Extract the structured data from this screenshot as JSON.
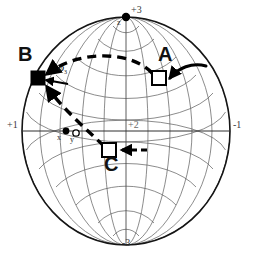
{
  "figure": {
    "type": "stereographic-sphere-diagram",
    "width": 253,
    "height": 261
  },
  "colors": {
    "background": "#ffffff",
    "grid": "#555555",
    "outline": "#1a1a1a",
    "marker": "#000000",
    "path": "#000000",
    "axis_text": "#3a3a3a"
  },
  "sphere": {
    "center_x": 126,
    "center_y": 131,
    "radius_x": 104,
    "radius_y": 114,
    "meridian_count": 12,
    "parallel_count": 11,
    "grid_visible": true
  },
  "axes": [
    {
      "id": "axis-plus-3",
      "label": "+3",
      "x": 131,
      "y": 9,
      "position": "top"
    },
    {
      "id": "axis-minus-3",
      "label": "-3",
      "x": 122,
      "y": 241,
      "position": "bottom"
    },
    {
      "id": "axis-plus-1",
      "label": "+1",
      "x": 9,
      "y": 124,
      "position": "left"
    },
    {
      "id": "axis-minus-1",
      "label": "-1",
      "x": 233,
      "y": 124,
      "position": "right"
    },
    {
      "id": "axis-plus-2",
      "label": "+2",
      "x": 127,
      "y": 124,
      "position": "center"
    }
  ],
  "reference_points": [
    {
      "id": "point-z",
      "label": "z",
      "style": "filled-dot",
      "x": 126,
      "y": 17,
      "label_x": 117,
      "label_y": 21
    },
    {
      "id": "point-x",
      "label": "x",
      "style": "filled-dot",
      "x": 66,
      "y": 131,
      "label_x": 58,
      "label_y": 136
    },
    {
      "id": "point-y",
      "label": "y",
      "style": "open-dot",
      "x": 76,
      "y": 133,
      "label_x": 70,
      "label_y": 137
    }
  ],
  "markers": [
    {
      "id": "marker-a",
      "label": "A",
      "style": "open-square",
      "x": 159,
      "y": 78,
      "label_x": 160,
      "label_y": 50
    },
    {
      "id": "marker-b",
      "label": "B",
      "style": "filled-square",
      "x": 38,
      "y": 78,
      "label_x": 19,
      "label_y": 50
    },
    {
      "id": "marker-c",
      "label": "C",
      "style": "open-square",
      "x": 109,
      "y": 150,
      "label_x": 108,
      "label_y": 157
    }
  ],
  "annotations": [
    {
      "id": "angle-phi",
      "label": "φ",
      "subscript": "3",
      "x": 60,
      "y": 66
    }
  ],
  "paths": [
    {
      "id": "path-a-to-b",
      "from": "A",
      "to": "B",
      "style": "dashed-arc",
      "arrow": true
    },
    {
      "id": "path-b-to-c",
      "from": "B",
      "to": "C",
      "style": "dashed-line",
      "arrow": true
    },
    {
      "id": "arrow-into-a",
      "target": "A",
      "style": "solid-curved-arrow",
      "direction": "left"
    },
    {
      "id": "arrow-into-c",
      "target": "C",
      "style": "dashed-arrow",
      "direction": "left"
    }
  ]
}
